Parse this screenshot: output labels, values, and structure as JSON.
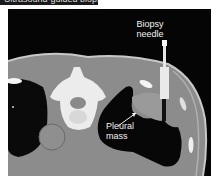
{
  "header": {
    "text": "Ultrasound-guided biopsy"
  },
  "figure": {
    "type": "CT axial scan",
    "annotations": [
      {
        "label": "Biopsy needle",
        "line1": "Biopsy",
        "line2": "needle"
      },
      {
        "label": "Pleural mass",
        "line1": "Pleural",
        "line2": "mass"
      }
    ],
    "colors": {
      "background": "#050505",
      "soft_tissue": "#8a8a8a",
      "bone": "#f0f0f0",
      "lung": "#0a0a0a"
    }
  }
}
